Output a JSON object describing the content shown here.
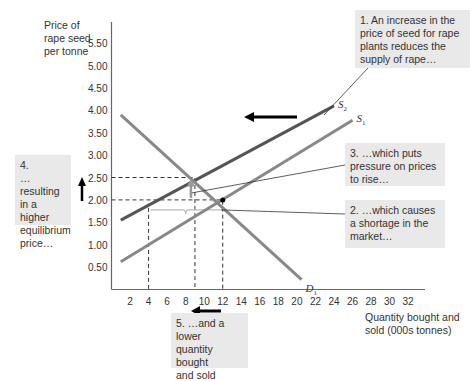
{
  "y_axis_label": [
    "Price of",
    "rape seed",
    "per tonne"
  ],
  "x_axis_label": [
    "Quantity bought and",
    "sold (000s tonnes)"
  ],
  "notes": {
    "n1": [
      "1. An increase in the",
      "price of seed for rape",
      "plants reduces the",
      "supply of rape…"
    ],
    "n2": [
      "2. …which causes",
      "a shortage in the",
      "market…"
    ],
    "n3": [
      "3. …which puts",
      "pressure on prices",
      "to rise…"
    ],
    "n4": [
      "4.",
      "…resulting",
      "in a higher",
      "equilibrium",
      "price…"
    ],
    "n5": [
      "5. …and a lower",
      "quantity bought",
      "and sold"
    ]
  },
  "chart_data": {
    "type": "line",
    "title": "",
    "xlabel": "Quantity bought and sold (000s tonnes)",
    "ylabel": "Price of rape seed per tonne",
    "xlim": [
      0,
      33
    ],
    "ylim": [
      0,
      5.75
    ],
    "x_ticks": [
      2,
      4,
      6,
      8,
      10,
      12,
      14,
      16,
      18,
      20,
      22,
      24,
      26,
      28,
      30,
      32
    ],
    "y_ticks": [
      0.5,
      1.0,
      1.5,
      2.0,
      2.5,
      3.0,
      3.5,
      4.0,
      4.5,
      5.0,
      5.5
    ],
    "y_tick_labels": [
      "0.50",
      "1.00",
      "1.50",
      "2.00",
      "2.50",
      "3.00",
      "3.50",
      "4.00",
      "4.50",
      "5.00",
      "5.50"
    ],
    "series": [
      {
        "name": "S2",
        "label_main": "S",
        "label_sub": "2",
        "color": "#555555",
        "points": [
          [
            1,
            1.55
          ],
          [
            24,
            4.1
          ]
        ]
      },
      {
        "name": "S1",
        "label_main": "S",
        "label_sub": "1",
        "color": "#888888",
        "points": [
          [
            1,
            0.62
          ],
          [
            26,
            3.78
          ]
        ]
      },
      {
        "name": "D1",
        "label_main": "D",
        "label_sub": "1",
        "color": "#888888",
        "points": [
          [
            1,
            3.9
          ],
          [
            20.5,
            0.22
          ]
        ]
      }
    ],
    "equilibria": [
      {
        "name": "original",
        "x": 12,
        "y": 2.0
      },
      {
        "name": "new",
        "x": 9,
        "y": 2.5
      }
    ],
    "shortage": {
      "from_x": 4,
      "to_x": 12,
      "price": 2.0
    }
  }
}
